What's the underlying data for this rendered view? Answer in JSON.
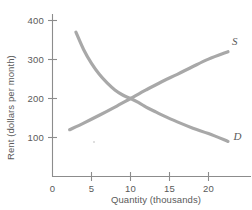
{
  "chart_data": {
    "type": "line",
    "title": "",
    "xlabel": "Quantity (thousands)",
    "ylabel": "Rent (dollars per month)",
    "xlim": [
      0,
      23
    ],
    "ylim": [
      0,
      430
    ],
    "xticks": [
      "0",
      "5",
      "10",
      "15",
      "20"
    ],
    "xtick_values": [
      0,
      5,
      10,
      15,
      20
    ],
    "yticks": [
      "100",
      "200",
      "300",
      "400"
    ],
    "ytick_values": [
      100,
      200,
      300,
      400
    ],
    "origin_label": "0",
    "grid": false,
    "legend_position": "inline-end-of-curve",
    "series": [
      {
        "name": "D",
        "label": "D",
        "description": "Demand curve, downward sloping convex",
        "color": "#a8a8a8",
        "x": [
          3.0,
          4.0,
          5.0,
          6.0,
          7.0,
          8.0,
          9.0,
          10.0,
          11.0,
          12.0,
          13.0,
          14.0,
          16.0,
          18.0,
          20.0,
          22.5
        ],
        "y": [
          370,
          325,
          290,
          262,
          240,
          222,
          209,
          200,
          190,
          178,
          168,
          158,
          140,
          124,
          110,
          90
        ]
      },
      {
        "name": "S",
        "label": "S",
        "description": "Supply curve, upward sloping slightly concave",
        "color": "#a8a8a8",
        "x": [
          2.2,
          4.0,
          6.0,
          8.0,
          10.0,
          12.0,
          14.0,
          16.0,
          18.0,
          20.0,
          22.5
        ],
        "y": [
          120,
          137,
          157,
          178,
          200,
          222,
          243,
          262,
          282,
          301,
          320
        ]
      }
    ],
    "annotations": [
      {
        "text": "S",
        "x": 23.0,
        "y": 337
      },
      {
        "text": "D",
        "x": 23.2,
        "y": 93
      }
    ],
    "equilibrium": {
      "x": 10,
      "y": 200
    }
  },
  "colors": {
    "curve": "#a8a8a8",
    "axis": "#8c8c8c",
    "text": "#5a5a5a",
    "background": "#ffffff"
  }
}
